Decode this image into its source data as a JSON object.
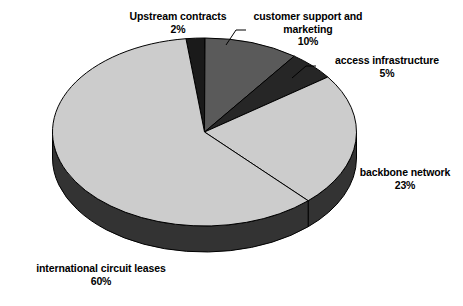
{
  "chart_data": {
    "type": "pie",
    "title": "",
    "subtitle": "",
    "xlabel": "",
    "ylabel": "",
    "grid": false,
    "legend_position": "none",
    "style": "3d-exploded-none",
    "units": "percent",
    "total": 100,
    "categories": [
      "Upstream contracts",
      "customer support and marketing",
      "access infrastructure",
      "backbone network",
      "international circuit leases"
    ],
    "values": [
      2,
      10,
      5,
      23,
      60
    ],
    "slices": [
      {
        "label": "Upstream contracts",
        "label_line1": "Upstream contracts",
        "label_line2": "",
        "percent_text": "2%",
        "value": 2,
        "color": "#1a1a1a",
        "side_color": "#101010",
        "leader": false
      },
      {
        "label": "customer support and marketing",
        "label_line1": "customer support and",
        "label_line2": "marketing",
        "percent_text": "10%",
        "value": 10,
        "color": "#5a5a5a",
        "side_color": "#3a3a3a",
        "leader": true
      },
      {
        "label": "access infrastructure",
        "label_line1": "access infrastructure",
        "label_line2": "",
        "percent_text": "5%",
        "value": 5,
        "color": "#262626",
        "side_color": "#171717",
        "leader": true
      },
      {
        "label": "backbone network",
        "label_line1": "backbone network",
        "label_line2": "",
        "percent_text": "23%",
        "value": 23,
        "color": "#cccccc",
        "side_color": "#333333",
        "leader": false
      },
      {
        "label": "international circuit leases",
        "label_line1": "international circuit leases",
        "label_line2": "",
        "percent_text": "60%",
        "value": 60,
        "color": "#cccccc",
        "side_color": "#333333",
        "leader": false
      }
    ],
    "colors": {
      "light_gray": "#cccccc",
      "medium_gray": "#5a5a5a",
      "near_black": "#262626",
      "black": "#1a1a1a",
      "side_wall": "#333333",
      "outline": "#000000",
      "background": "#ffffff",
      "text": "#000000"
    }
  }
}
